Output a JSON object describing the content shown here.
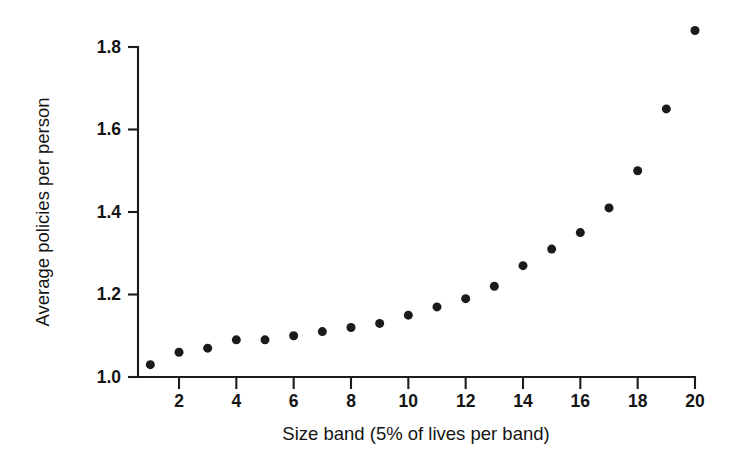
{
  "chart_data": {
    "type": "scatter",
    "title": "",
    "xlabel": "Size band (5% of lives per band)",
    "ylabel": "Average policies per person",
    "x": [
      1,
      2,
      3,
      4,
      5,
      6,
      7,
      8,
      9,
      10,
      11,
      12,
      13,
      14,
      15,
      16,
      17,
      18,
      19,
      20
    ],
    "values": [
      1.03,
      1.06,
      1.07,
      1.09,
      1.09,
      1.1,
      1.11,
      1.12,
      1.13,
      1.15,
      1.17,
      1.19,
      1.22,
      1.27,
      1.31,
      1.35,
      1.41,
      1.5,
      1.65,
      1.84
    ],
    "xlim": [
      0,
      20.6
    ],
    "ylim": [
      1.0,
      1.84
    ],
    "xticks": [
      2,
      4,
      6,
      8,
      10,
      12,
      14,
      16,
      18,
      20
    ],
    "xtick_labels": [
      "2",
      "4",
      "6",
      "8",
      "10",
      "12",
      "14",
      "16",
      "18",
      "20"
    ],
    "yticks": [
      1.0,
      1.2,
      1.4,
      1.6,
      1.8
    ],
    "ytick_labels": [
      "1.0",
      "1.2",
      "1.4",
      "1.6",
      "1.8"
    ],
    "grid": false,
    "legend": false,
    "marker": "filled-circle",
    "marker_color": "#1b1b1b",
    "marker_size": 9,
    "axis_color": "#1c1c1c",
    "background_color": "#ffffff"
  },
  "axes": {
    "y_axis_title": "Average policies per person",
    "x_axis_title": "Size band (5% of lives per band)"
  }
}
